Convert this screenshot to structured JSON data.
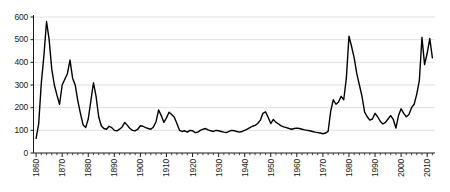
{
  "chart_data": {
    "type": "line",
    "title": "",
    "subtitle": "",
    "xlabel": "",
    "ylabel": "",
    "xlim": [
      1859,
      2013
    ],
    "ylim": [
      0,
      600
    ],
    "yticks": [
      0,
      100,
      200,
      300,
      400,
      500,
      600
    ],
    "ytick_labels": [
      "0",
      "100",
      "200",
      "300",
      "400",
      "500",
      "600"
    ],
    "xticks": [
      1860,
      1870,
      1880,
      1890,
      1900,
      1910,
      1920,
      1930,
      1940,
      1950,
      1960,
      1970,
      1980,
      1990,
      2000,
      2010
    ],
    "xtick_labels": [
      "1860",
      "1870",
      "1880",
      "1890",
      "1900",
      "1910",
      "1920",
      "1930",
      "1940",
      "1950",
      "1960",
      "1970",
      "1980",
      "1990",
      "2000",
      "2010"
    ],
    "minor_tick_interval": 2,
    "grid": "horizontal",
    "grid_color": "#d9d9d9",
    "axis_color": "#1a1a1a",
    "line_color": "#000000",
    "line_width": 1.4,
    "legend": null,
    "annotations": [],
    "series": [
      {
        "name": "series-1",
        "x": [
          1860,
          1861,
          1862,
          1863,
          1864,
          1865,
          1866,
          1867,
          1868,
          1869,
          1870,
          1871,
          1872,
          1873,
          1874,
          1875,
          1876,
          1877,
          1878,
          1879,
          1880,
          1881,
          1882,
          1883,
          1884,
          1885,
          1886,
          1887,
          1888,
          1889,
          1890,
          1891,
          1892,
          1893,
          1894,
          1895,
          1896,
          1897,
          1898,
          1899,
          1900,
          1901,
          1902,
          1903,
          1904,
          1905,
          1906,
          1907,
          1908,
          1909,
          1910,
          1911,
          1912,
          1913,
          1914,
          1915,
          1916,
          1917,
          1918,
          1919,
          1920,
          1921,
          1922,
          1923,
          1924,
          1925,
          1926,
          1927,
          1928,
          1929,
          1930,
          1931,
          1932,
          1933,
          1934,
          1935,
          1936,
          1937,
          1938,
          1939,
          1940,
          1941,
          1942,
          1943,
          1944,
          1945,
          1946,
          1947,
          1948,
          1949,
          1950,
          1951,
          1952,
          1953,
          1954,
          1955,
          1956,
          1957,
          1958,
          1959,
          1960,
          1961,
          1962,
          1963,
          1964,
          1965,
          1966,
          1967,
          1968,
          1969,
          1970,
          1971,
          1972,
          1973,
          1974,
          1975,
          1976,
          1977,
          1978,
          1979,
          1980,
          1981,
          1982,
          1983,
          1984,
          1985,
          1986,
          1987,
          1988,
          1989,
          1990,
          1991,
          1992,
          1993,
          1994,
          1995,
          1996,
          1997,
          1998,
          1999,
          2000,
          2001,
          2002,
          2003,
          2004,
          2005,
          2006,
          2007,
          2008,
          2009,
          2010,
          2011,
          2012
        ],
        "y": [
          65,
          130,
          310,
          430,
          580,
          500,
          370,
          300,
          255,
          215,
          300,
          325,
          350,
          410,
          330,
          300,
          230,
          175,
          125,
          112,
          150,
          230,
          310,
          250,
          160,
          120,
          108,
          105,
          118,
          112,
          100,
          98,
          105,
          115,
          135,
          122,
          108,
          100,
          98,
          105,
          120,
          118,
          112,
          108,
          105,
          115,
          138,
          190,
          165,
          135,
          155,
          180,
          170,
          158,
          130,
          100,
          95,
          98,
          92,
          100,
          98,
          90,
          92,
          100,
          105,
          108,
          102,
          98,
          95,
          100,
          98,
          95,
          92,
          90,
          95,
          100,
          98,
          95,
          92,
          95,
          100,
          105,
          112,
          118,
          122,
          130,
          145,
          175,
          182,
          158,
          130,
          148,
          135,
          128,
          120,
          115,
          112,
          108,
          105,
          108,
          110,
          108,
          105,
          102,
          100,
          98,
          95,
          92,
          90,
          88,
          85,
          88,
          95,
          185,
          235,
          215,
          225,
          250,
          235,
          330,
          515,
          470,
          420,
          350,
          300,
          250,
          180,
          160,
          145,
          150,
          175,
          160,
          140,
          128,
          135,
          150,
          165,
          148,
          110,
          165,
          195,
          175,
          160,
          170,
          200,
          215,
          260,
          320,
          510,
          390,
          440,
          505,
          420
        ]
      }
    ]
  },
  "axes": {
    "y_title": "",
    "x_title": ""
  }
}
